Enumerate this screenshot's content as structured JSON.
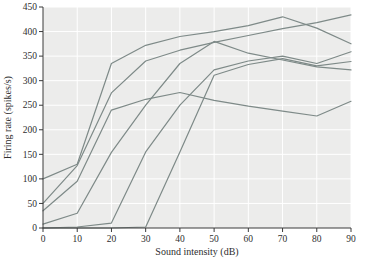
{
  "chart_data": {
    "type": "line",
    "title": "",
    "xlabel": "Sound intensity (dB)",
    "ylabel": "Firing rate (spikes/s)",
    "xlim": [
      0,
      90
    ],
    "ylim": [
      0,
      450
    ],
    "xticks": [
      0,
      10,
      20,
      30,
      40,
      50,
      60,
      70,
      80,
      90
    ],
    "yticks": [
      0,
      50,
      100,
      150,
      200,
      250,
      300,
      350,
      400,
      450
    ],
    "grid": true,
    "legend": "none",
    "x": [
      0,
      10,
      20,
      30,
      40,
      50,
      60,
      70,
      80,
      90
    ],
    "series": [
      {
        "name": "fiber-1",
        "values": [
          100,
          130,
          335,
          372,
          390,
          400,
          412,
          430,
          407,
          375
        ]
      },
      {
        "name": "fiber-2",
        "values": [
          50,
          127,
          275,
          340,
          362,
          378,
          392,
          406,
          418,
          434
        ]
      },
      {
        "name": "fiber-3",
        "values": [
          35,
          95,
          240,
          262,
          276,
          260,
          248,
          238,
          228,
          258
        ]
      },
      {
        "name": "fiber-4",
        "values": [
          8,
          30,
          154,
          250,
          335,
          380,
          356,
          342,
          328,
          322
        ]
      },
      {
        "name": "fiber-5",
        "values": [
          0,
          2,
          10,
          155,
          250,
          322,
          340,
          350,
          335,
          359
        ]
      },
      {
        "name": "fiber-6",
        "values": [
          0,
          0,
          0,
          2,
          155,
          311,
          333,
          345,
          330,
          339
        ]
      }
    ],
    "colors": {
      "line": "#7e8a88",
      "plot_bg": "#ececeb",
      "grid": "#ffffff",
      "axis": "#3a3a3a",
      "text": "#2e2e2e"
    }
  }
}
